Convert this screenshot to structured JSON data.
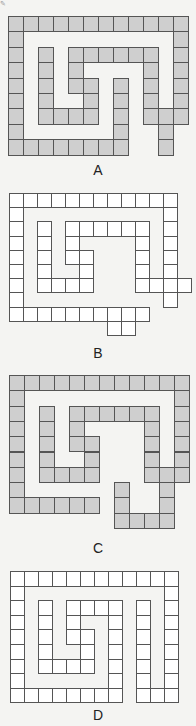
{
  "corner_mark": "✎",
  "fill_colors": {
    "shaded": "#cfcfcf",
    "empty": "#ffffff"
  },
  "figures": [
    {
      "label": "A",
      "x": 8,
      "y": 16,
      "cw": 15,
      "ch": 15.4,
      "shaded": true,
      "label_y": 162,
      "rows": [
        [
          0,
          1,
          2,
          3,
          4,
          5,
          6,
          7,
          8,
          9,
          10,
          11
        ],
        [
          0,
          11
        ],
        [
          0,
          2,
          4,
          5,
          6,
          7,
          8,
          9,
          11
        ],
        [
          0,
          2,
          4,
          9,
          11
        ],
        [
          0,
          2,
          4,
          5,
          7,
          9,
          11
        ],
        [
          0,
          2,
          5,
          7,
          9,
          11
        ],
        [
          0,
          2,
          3,
          4,
          5,
          7,
          9,
          10,
          11
        ],
        [
          0,
          7,
          10
        ],
        [
          0,
          1,
          2,
          3,
          4,
          5,
          6,
          7,
          10
        ]
      ]
    },
    {
      "label": "B",
      "x": 9,
      "y": 193,
      "cw": 14,
      "ch": 14.2,
      "shaded": false,
      "label_y": 345,
      "rows": [
        [
          0,
          1,
          2,
          3,
          4,
          5,
          6,
          7,
          8,
          9,
          10,
          11
        ],
        [
          0,
          11
        ],
        [
          0,
          2,
          4,
          5,
          6,
          7,
          8,
          9,
          11
        ],
        [
          0,
          2,
          4,
          9,
          11
        ],
        [
          0,
          2,
          4,
          5,
          9,
          11
        ],
        [
          0,
          2,
          5,
          9,
          11
        ],
        [
          0,
          2,
          3,
          4,
          5,
          9,
          10,
          11,
          12
        ],
        [
          0,
          11
        ],
        [
          0,
          1,
          2,
          3,
          4,
          5,
          6,
          7,
          8,
          9
        ],
        [
          7,
          8
        ]
      ]
    },
    {
      "label": "C",
      "x": 9,
      "y": 375,
      "cw": 15,
      "ch": 15.3,
      "shaded": true,
      "label_y": 540,
      "rows": [
        [
          0,
          1,
          2,
          3,
          4,
          5,
          6,
          7,
          8,
          9,
          10,
          11
        ],
        [
          0,
          11
        ],
        [
          0,
          2,
          4,
          5,
          6,
          7,
          8,
          9,
          11
        ],
        [
          0,
          2,
          4,
          9,
          11
        ],
        [
          0,
          2,
          4,
          5,
          9,
          11
        ],
        [
          0,
          2,
          5,
          9,
          11
        ],
        [
          0,
          2,
          3,
          4,
          5,
          9,
          10,
          11
        ],
        [
          0,
          7,
          10
        ],
        [
          0,
          1,
          2,
          3,
          4,
          5,
          7,
          10
        ],
        [
          7,
          8,
          9,
          10
        ]
      ]
    },
    {
      "label": "D",
      "x": 10,
      "y": 571,
      "cw": 14,
      "ch": 14.6,
      "shaded": false,
      "label_y": 707,
      "rows": [
        [
          0,
          1,
          2,
          3,
          4,
          5,
          6,
          7,
          8,
          9,
          10,
          11
        ],
        [
          0,
          11
        ],
        [
          0,
          2,
          4,
          5,
          6,
          7,
          9,
          11
        ],
        [
          0,
          2,
          4,
          7,
          9,
          11
        ],
        [
          0,
          2,
          4,
          5,
          7,
          9,
          11
        ],
        [
          0,
          2,
          5,
          7,
          9,
          11
        ],
        [
          0,
          2,
          3,
          4,
          5,
          7,
          9,
          11
        ],
        [
          0,
          7,
          9,
          11
        ],
        [
          0,
          1,
          2,
          3,
          4,
          5,
          6,
          7,
          9,
          10,
          11
        ]
      ]
    }
  ]
}
